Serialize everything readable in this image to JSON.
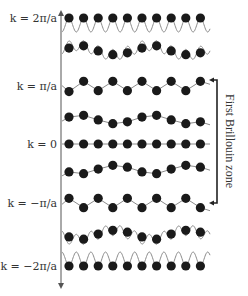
{
  "colors": {
    "atom": "#1a1a1a",
    "wave": "#8a8a8a",
    "axis": "#555555",
    "bracket": "#222222"
  },
  "atoms_per_row": 10,
  "rows": [
    {
      "label": "k = 2π/a",
      "k_over_pi_a": 2,
      "labeled": true,
      "mode": "zone-edge-2",
      "atom_displacement": [
        0,
        0,
        0,
        0,
        0,
        0,
        0,
        0,
        0,
        0
      ],
      "carrier_wave": "fast-below"
    },
    {
      "label": "",
      "k_over_pi_a": 1.5,
      "labeled": false,
      "mode": "intermediate",
      "atom_displacement": [
        0.2,
        0.45,
        -0.1,
        -0.5,
        -0.3,
        0.2,
        0.45,
        -0.1,
        -0.5,
        -0.3
      ],
      "carrier_wave": "fast-through"
    },
    {
      "label": "k = π/a",
      "k_over_pi_a": 1,
      "labeled": true,
      "mode": "alternating",
      "atom_displacement": [
        -0.6,
        0.5,
        -0.5,
        0.5,
        -0.5,
        0.5,
        -0.5,
        0.5,
        -0.5,
        0.5
      ],
      "carrier_wave": "zigzag"
    },
    {
      "label": "",
      "k_over_pi_a": 0.4,
      "labeled": false,
      "mode": "long-wave",
      "atom_displacement": [
        0.2,
        0.4,
        -0.1,
        -0.5,
        -0.3,
        0.2,
        0.4,
        -0.1,
        -0.5,
        -0.3
      ],
      "carrier_wave": "smooth"
    },
    {
      "label": "k = 0",
      "k_over_pi_a": 0,
      "labeled": true,
      "mode": "uniform",
      "atom_displacement": [
        0,
        0,
        0,
        0,
        0,
        0,
        0,
        0,
        0,
        0
      ],
      "carrier_wave": "flat"
    },
    {
      "label": "",
      "k_over_pi_a": -0.4,
      "labeled": false,
      "mode": "long-wave",
      "atom_displacement": [
        -0.2,
        -0.4,
        0.1,
        0.5,
        0.3,
        -0.2,
        -0.4,
        0.1,
        0.5,
        0.3
      ],
      "carrier_wave": "smooth"
    },
    {
      "label": "k = −π/a",
      "k_over_pi_a": -1,
      "labeled": true,
      "mode": "alternating",
      "atom_displacement": [
        0.5,
        -0.5,
        0.5,
        -0.5,
        0.5,
        -0.5,
        0.5,
        -0.5,
        0.5,
        -0.5
      ],
      "carrier_wave": "zigzag"
    },
    {
      "label": "",
      "k_over_pi_a": -1.5,
      "labeled": false,
      "mode": "intermediate",
      "atom_displacement": [
        -0.2,
        -0.45,
        0.1,
        0.5,
        0.3,
        -0.2,
        -0.45,
        0.1,
        0.5,
        0.3
      ],
      "carrier_wave": "fast-through"
    },
    {
      "label": "k = −2π/a",
      "k_over_pi_a": -2,
      "labeled": true,
      "mode": "zone-edge-2",
      "atom_displacement": [
        0,
        0,
        0,
        0,
        0,
        0,
        0,
        0,
        0,
        0
      ],
      "carrier_wave": "fast-above"
    }
  ],
  "brillouin_zone": {
    "label": "First Brillouin zone",
    "from_k": "π/a",
    "to_k": "−π/a"
  }
}
